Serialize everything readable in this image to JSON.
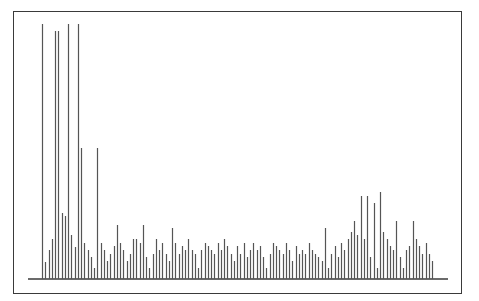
{
  "chart_data": {
    "type": "bar",
    "style": "stick-spectrum",
    "title": "",
    "xlabel": "",
    "ylabel": "",
    "grid": false,
    "legend": null,
    "axis_ticks_visible": false,
    "bar_color": "#555555",
    "frame_color": "#3a3a3a",
    "baseline_y_px": 279,
    "x_start_px": 42,
    "x_step_px": 3.63,
    "baseline_from_px": 28,
    "baseline_to_px": 448,
    "ylim": [
      0,
      255
    ],
    "values": [
      255,
      17,
      29,
      40,
      248,
      248,
      66,
      63,
      255,
      44,
      32,
      255,
      131,
      36,
      29,
      22,
      11,
      131,
      36,
      29,
      18,
      25,
      33,
      54,
      36,
      29,
      18,
      25,
      40,
      40,
      36,
      54,
      22,
      11,
      25,
      40,
      29,
      36,
      25,
      18,
      51,
      36,
      25,
      33,
      29,
      40,
      29,
      25,
      11,
      29,
      36,
      33,
      29,
      25,
      36,
      29,
      40,
      33,
      25,
      18,
      33,
      25,
      36,
      22,
      29,
      36,
      29,
      33,
      22,
      11,
      25,
      36,
      33,
      29,
      25,
      36,
      29,
      18,
      33,
      25,
      29,
      25,
      36,
      29,
      25,
      22,
      18,
      51,
      11,
      25,
      33,
      22,
      36,
      29,
      40,
      47,
      58,
      44,
      83,
      40,
      83,
      22,
      76,
      11,
      87,
      47,
      40,
      33,
      29,
      58,
      22,
      11,
      29,
      33,
      58,
      40,
      33,
      25,
      36,
      25,
      18
    ]
  }
}
